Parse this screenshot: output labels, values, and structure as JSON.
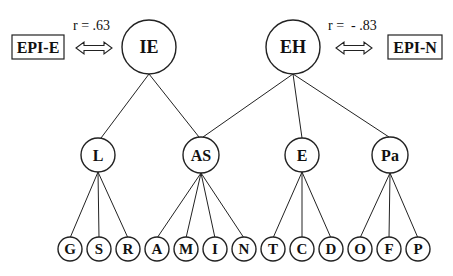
{
  "diagram": {
    "top_nodes": [
      {
        "id": "IE",
        "label": "IE"
      },
      {
        "id": "EH",
        "label": "EH"
      }
    ],
    "external_scales": [
      {
        "id": "EPI-E",
        "label": "EPI-E",
        "linked_to": "IE",
        "correlation": "r = .63"
      },
      {
        "id": "EPI-N",
        "label": "EPI-N",
        "linked_to": "EH",
        "correlation": "r =  - .83"
      }
    ],
    "mid_nodes": [
      {
        "id": "L",
        "label": "L",
        "parents": [
          "IE"
        ]
      },
      {
        "id": "AS",
        "label": "AS",
        "parents": [
          "IE",
          "EH"
        ]
      },
      {
        "id": "E",
        "label": "E",
        "parents": [
          "EH"
        ]
      },
      {
        "id": "Pa",
        "label": "Pa",
        "parents": [
          "EH"
        ]
      }
    ],
    "leaf_nodes": [
      {
        "id": "G",
        "label": "G",
        "parent": "L"
      },
      {
        "id": "S",
        "label": "S",
        "parent": "L"
      },
      {
        "id": "R",
        "label": "R",
        "parent": "L"
      },
      {
        "id": "A",
        "label": "A",
        "parent": "AS"
      },
      {
        "id": "M",
        "label": "M",
        "parent": "AS"
      },
      {
        "id": "I",
        "label": "I",
        "parent": "AS"
      },
      {
        "id": "N",
        "label": "N",
        "parent": "AS"
      },
      {
        "id": "T",
        "label": "T",
        "parent": "E"
      },
      {
        "id": "C",
        "label": "C",
        "parent": "E"
      },
      {
        "id": "D",
        "label": "D",
        "parent": "E"
      },
      {
        "id": "O",
        "label": "O",
        "parent": "Pa"
      },
      {
        "id": "F",
        "label": "F",
        "parent": "Pa"
      },
      {
        "id": "P",
        "label": "P",
        "parent": "Pa"
      }
    ]
  }
}
